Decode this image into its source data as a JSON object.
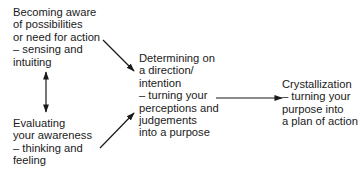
{
  "diagram": {
    "nodes": [
      {
        "id": "becoming-aware",
        "lines": [
          "Becoming aware",
          "of possibilities",
          "or need for action",
          "– sensing and",
          "intuiting"
        ]
      },
      {
        "id": "evaluating",
        "lines": [
          "Evaluating",
          "your awareness",
          "– thinking and",
          "feeling"
        ]
      },
      {
        "id": "determining",
        "lines": [
          "Determining on",
          "a direction/",
          "intention",
          "– turning your",
          "perceptions and",
          "judgements",
          "into a purpose"
        ]
      },
      {
        "id": "crystallization",
        "lines": [
          "Crystallization",
          "– turning your",
          "purpose into",
          "a plan of action"
        ]
      }
    ],
    "edges": [
      {
        "from": "becoming-aware",
        "to": "evaluating",
        "type": "bidirectional"
      },
      {
        "from": "becoming-aware",
        "to": "determining",
        "type": "directed"
      },
      {
        "from": "evaluating",
        "to": "determining",
        "type": "directed"
      },
      {
        "from": "determining",
        "to": "crystallization",
        "type": "directed"
      }
    ],
    "colors": {
      "text": "#1a1a1a",
      "arrow": "#1a1a1a",
      "background": "#ffffff"
    }
  }
}
